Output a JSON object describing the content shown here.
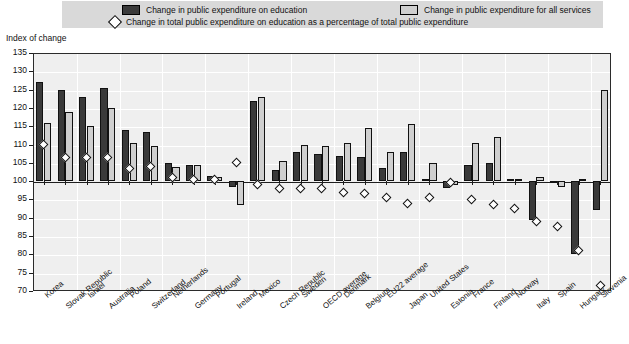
{
  "legend": {
    "dark_label": "Change in public expenditure on education",
    "light_label": "Change in public expenditure for all services",
    "diamond_label": "Change in total public expenditure on education as a percentage of total public expenditure",
    "dark_color": "#3a3a3a",
    "light_color": "#cfcfcf",
    "diamond_color": "#ffffff",
    "background": "#d9d9d9"
  },
  "axis": {
    "y_title": "Index of change",
    "y_ticks": [
      135,
      130,
      125,
      120,
      115,
      110,
      105,
      100,
      95,
      90,
      85,
      80,
      75,
      70
    ],
    "reference_value": 100
  },
  "chart_data": {
    "type": "bar",
    "title": "Index of change",
    "xlabel": "",
    "ylabel": "Index of change",
    "ylim": [
      70,
      135
    ],
    "grid": true,
    "legend_position": "top",
    "categories": [
      "Korea",
      "Slovak Republic",
      "Israel",
      "Australia",
      "Poland",
      "Switzerland",
      "Netherlands",
      "Germany",
      "Portugal",
      "Ireland",
      "Mexico",
      "Czech Republic",
      "Sweden",
      "OECD average",
      "Denmark",
      "Belgium",
      "EU22 average",
      "Japan",
      "United States",
      "Estonia",
      "France",
      "Finland",
      "Norway",
      "Italy",
      "Spain",
      "Hungary",
      "Slovenia"
    ],
    "series": [
      {
        "name": "Change in public expenditure on education",
        "type": "bar",
        "color": "#3a3a3a",
        "values": [
          127,
          125,
          123,
          125.5,
          114,
          113.5,
          105,
          104.5,
          101.5,
          98.5,
          122,
          103,
          108,
          107.5,
          107,
          106.5,
          103.5,
          108,
          100.5,
          98,
          104.5,
          105,
          100.5,
          89.5,
          100,
          80,
          92
        ]
      },
      {
        "name": "Change in public expenditure for all services",
        "type": "bar",
        "color": "#cfcfcf",
        "values": [
          116,
          119,
          115,
          120,
          110.5,
          109.5,
          104,
          104.5,
          101,
          93.5,
          123,
          105.5,
          110,
          109.5,
          110.5,
          114.5,
          108,
          115.5,
          105,
          99,
          110.5,
          112,
          100.5,
          101,
          98.5,
          100.5,
          125
        ]
      },
      {
        "name": "Change in total public expenditure on education as a percentage of total public expenditure",
        "type": "scatter",
        "color": "#ffffff",
        "values": [
          110,
          106.5,
          106.5,
          106.5,
          103.5,
          104,
          101,
          100.5,
          100.5,
          105,
          99,
          98,
          98,
          98,
          97,
          96.5,
          95.5,
          94,
          95.5,
          99.5,
          95,
          93.5,
          92.5,
          89,
          87.5,
          81,
          71.5
        ]
      }
    ]
  }
}
